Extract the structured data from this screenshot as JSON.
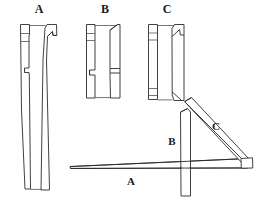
{
  "figure": {
    "background_color": "#ffffff",
    "line_color": "#2b2b2b",
    "width": 260,
    "height": 202
  },
  "parts": [
    {
      "id": "A",
      "label": "A",
      "label_x": 39,
      "label_y": 10,
      "description": "Long tapered beam, shown as narrow edge view and wide face view",
      "views": [
        "edge",
        "face"
      ]
    },
    {
      "id": "B",
      "label": "B",
      "label_x": 105,
      "label_y": 10,
      "description": "Short post with notch, shown as narrow edge view and wide face view",
      "views": [
        "edge",
        "face"
      ]
    },
    {
      "id": "C",
      "label": "C",
      "label_x": 167,
      "label_y": 10,
      "description": "Diagonal brace with angled foot, shown as narrow edge view and wide face view",
      "views": [
        "edge",
        "face"
      ]
    }
  ],
  "assembly": {
    "name": "assembly-view",
    "description": "Triangular bracket: horizontal beam A, vertical post B, diagonal brace C",
    "labels": [
      {
        "id": "A",
        "text": "A",
        "x": 131,
        "y": 182
      },
      {
        "id": "B",
        "text": "B",
        "x": 172,
        "y": 142
      },
      {
        "id": "C",
        "text": "C",
        "x": 216,
        "y": 127
      }
    ]
  }
}
